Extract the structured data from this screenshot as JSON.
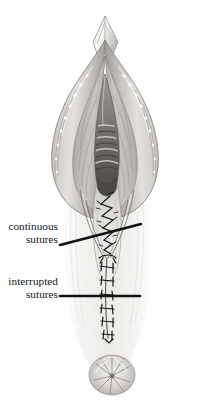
{
  "figure": {
    "name": "perineal-suture-repair",
    "style": "grayscale pen-and-wash anatomical illustration",
    "background_color": "#fefefe",
    "ink_color": "#161616",
    "tissue_light": "#f2f1ef",
    "tissue_mid": "#c9c7c4",
    "tissue_dark": "#8d8b88",
    "tissue_shadow": "#6d6b68",
    "highlight_color": "#ffffff"
  },
  "annotations": [
    {
      "id": "continuous",
      "line1": "continuous",
      "line2": "sutures",
      "leader": {
        "type": "diagonal",
        "x1": 60,
        "y1": 245,
        "x2": 141,
        "y2": 224
      }
    },
    {
      "id": "interrupted",
      "line1": "interrupted",
      "line2": "sutures",
      "leader": {
        "type": "horizontal",
        "x1": 60,
        "y1": 296,
        "x2": 140,
        "y2": 296
      }
    }
  ],
  "anatomy": {
    "apex_label": "dorsal commissure",
    "left_labium_label": "left labium",
    "right_labium_label": "right labium",
    "vestibule_label": "vestibule",
    "anus_label": "anus",
    "perineal_body_label": "perineal body"
  },
  "suture_detail": {
    "continuous_stitch_count": 7,
    "interrupted_stitch_count": 6,
    "continuous_top_y": 198,
    "continuous_bottom_y": 258,
    "interrupted_top_y": 258,
    "interrupted_bottom_y": 338
  }
}
